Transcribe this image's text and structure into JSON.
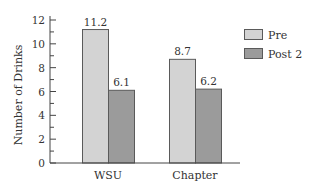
{
  "chart_data": {
    "type": "bar",
    "title": "",
    "xlabel": "",
    "ylabel": "Number of Drinks",
    "ylim": [
      0,
      12
    ],
    "yticks": [
      0,
      2,
      4,
      6,
      8,
      10,
      12
    ],
    "minor_ticks": true,
    "grid": false,
    "legend_position": "right",
    "categories": [
      "WSU",
      "Chapter"
    ],
    "series": [
      {
        "name": "Pre",
        "values": [
          11.2,
          8.7
        ],
        "labels": [
          "11.2",
          "8.7"
        ],
        "color": "#d3d3d3"
      },
      {
        "name": "Post 2",
        "values": [
          6.1,
          6.2
        ],
        "labels": [
          "6.1",
          "6.2"
        ],
        "color": "#9b9b9b"
      }
    ]
  },
  "legend": {
    "items": [
      {
        "label": "Pre",
        "color": "#d3d3d3"
      },
      {
        "label": "Post 2",
        "color": "#9b9b9b"
      }
    ]
  },
  "axis": {
    "ylabel": "Number of Drinks",
    "tick_labels": [
      "0",
      "2",
      "4",
      "6",
      "8",
      "10",
      "12"
    ]
  },
  "colors": {
    "bar_border": "#5a5a5a",
    "axis": "#444444"
  }
}
